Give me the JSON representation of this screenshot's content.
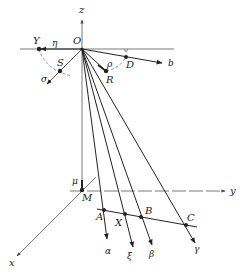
{
  "diagram": {
    "type": "3d-geometry-projection",
    "axes": {
      "z": "z",
      "y": "y",
      "x": "x"
    },
    "points": {
      "origin": "O",
      "Y": "Y",
      "S": "S",
      "R": "R",
      "D": "D",
      "M": "M",
      "A": "A",
      "X": "X",
      "B": "B",
      "C": "C"
    },
    "vectors": {
      "eta": "η",
      "sigma": "σ",
      "rho": "ρ",
      "b": "b",
      "mu": "μ",
      "alpha": "α",
      "xi": "ξ",
      "beta": "β",
      "gamma": "γ"
    },
    "colors": {
      "line": "#222222",
      "axis": "#555555",
      "dashed": "#666666"
    }
  }
}
